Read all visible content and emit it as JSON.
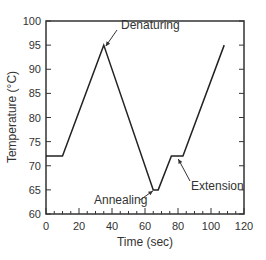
{
  "chart_data": {
    "type": "line",
    "title": "",
    "xlabel": "Time (sec)",
    "ylabel": "Temperature (°C)",
    "xlim": [
      0,
      120
    ],
    "ylim": [
      60,
      100
    ],
    "xticks": [
      0,
      20,
      40,
      60,
      80,
      100,
      120
    ],
    "yticks": [
      60,
      65,
      70,
      75,
      80,
      85,
      90,
      95,
      100
    ],
    "grid": false,
    "legend": null,
    "series": [
      {
        "name": "PCR cycle",
        "x": [
          0,
          10,
          35,
          65,
          68,
          76,
          83,
          108
        ],
        "y": [
          72,
          72,
          95,
          65,
          65,
          72,
          72,
          95
        ]
      }
    ],
    "annotations": [
      {
        "text": "Denaturing",
        "x": 35,
        "y": 95
      },
      {
        "text": "Annealing",
        "x": 66,
        "y": 65
      },
      {
        "text": "Extension",
        "x": 82,
        "y": 72
      }
    ]
  },
  "labels": {
    "xlabel": "Time (sec)",
    "ylabel": "Temperature (°C)",
    "denaturing": "Denaturing",
    "annealing": "Annealing",
    "extension": "Extension"
  }
}
